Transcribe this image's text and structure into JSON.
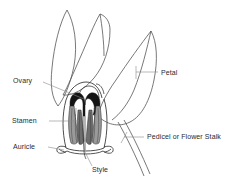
{
  "figure": {
    "background_color": "#ffffff",
    "ink_color": "#2b2b2b",
    "line_color": "#555555",
    "leader_color": "#808080",
    "shading_dark": "#1a1a1a",
    "shading_mid": "#8f8f8f",
    "shading_light": "#cccccc"
  },
  "labels": [
    {
      "id": "ovary",
      "text": "Ovary"
    },
    {
      "id": "stamen",
      "text": "Stamen"
    },
    {
      "id": "auricle",
      "text": "Auricle"
    },
    {
      "id": "style",
      "text": "Style"
    },
    {
      "id": "petal",
      "text": "Petal"
    },
    {
      "id": "pedicel",
      "text": "Pedicel or Flower Stalk"
    }
  ],
  "parts": [
    {
      "id": "petal-left",
      "name": "Petal (left, upright)"
    },
    {
      "id": "petal-middle",
      "name": "Petal (middle)"
    },
    {
      "id": "petal-right",
      "name": "Petal (right, large)"
    },
    {
      "id": "ovary",
      "name": "Ovary"
    },
    {
      "id": "stamen",
      "name": "Stamen"
    },
    {
      "id": "style",
      "name": "Style"
    },
    {
      "id": "auricle",
      "name": "Auricle"
    },
    {
      "id": "pedicel",
      "name": "Pedicel or Flower Stalk"
    }
  ]
}
